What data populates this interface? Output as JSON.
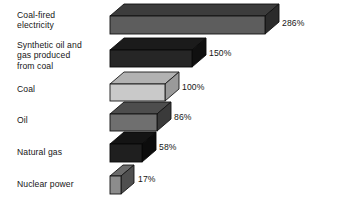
{
  "chart_data": {
    "type": "bar",
    "orientation": "horizontal",
    "style": "3d-isometric",
    "title": "",
    "subtitle": "",
    "xlabel": "",
    "ylabel": "",
    "units": "%",
    "grid": false,
    "legend": null,
    "axis_visible": false,
    "tick_labels": [],
    "xlim": [
      0,
      286
    ],
    "baseline_category": "Coal",
    "baseline_value": 100,
    "categories": [
      "Coal-fired\nelectricity",
      "Synthetic oil and\ngas produced\nfrom coal",
      "Coal",
      "Oil",
      "Natural gas",
      "Nuclear power"
    ],
    "values": [
      286,
      150,
      100,
      86,
      58,
      17
    ],
    "data_labels": [
      "286%",
      "150%",
      "100%",
      "86%",
      "58%",
      "17%"
    ],
    "bar_colors": [
      "#5d5d5d",
      "#262626",
      "#c9c9c9",
      "#6f6f6f",
      "#1f1f1f",
      "#8c8c8c"
    ]
  },
  "bars": [
    {
      "label": "Coal-fired\nelectricity",
      "value_label": "286%",
      "label_top": 10,
      "label_lines": 2,
      "front_x": 110,
      "front_y": 16,
      "front_w": 155,
      "front_h": 18,
      "depth_x": 14,
      "depth_y": 12,
      "face_front": "#5d5d5d",
      "face_top": "#3c3c3c",
      "face_side": "#2b2b2b",
      "edge": "#111111",
      "value_x": 282,
      "value_y": 18
    },
    {
      "label": "Synthetic oil and\ngas produced\nfrom coal",
      "value_label": "150%",
      "label_top": 40,
      "label_lines": 3,
      "front_x": 110,
      "front_y": 50,
      "front_w": 82,
      "front_h": 17,
      "depth_x": 14,
      "depth_y": 12,
      "face_front": "#262626",
      "face_top": "#1b1b1b",
      "face_side": "#101010",
      "edge": "#0a0a0a",
      "value_x": 209,
      "value_y": 48
    },
    {
      "label": "Coal",
      "value_label": "100%",
      "label_top": 84,
      "label_lines": 1,
      "front_x": 110,
      "front_y": 84,
      "front_w": 55,
      "front_h": 17,
      "depth_x": 14,
      "depth_y": 12,
      "face_front": "#c9c9c9",
      "face_top": "#b2b2b2",
      "face_side": "#9a9a9a",
      "edge": "#1a1a1a",
      "value_x": 182,
      "value_y": 82
    },
    {
      "label": "Oil",
      "value_label": "86%",
      "label_top": 115,
      "label_lines": 1,
      "front_x": 110,
      "front_y": 114,
      "front_w": 47,
      "front_h": 17,
      "depth_x": 14,
      "depth_y": 12,
      "face_front": "#6f6f6f",
      "face_top": "#4d4d4d",
      "face_side": "#3a3a3a",
      "edge": "#121212",
      "value_x": 174,
      "value_y": 112
    },
    {
      "label": "Natural gas",
      "value_label": "58%",
      "label_top": 147,
      "label_lines": 1,
      "front_x": 110,
      "front_y": 144,
      "front_w": 32,
      "front_h": 18,
      "depth_x": 14,
      "depth_y": 12,
      "face_front": "#1f1f1f",
      "face_top": "#141414",
      "face_side": "#0c0c0c",
      "edge": "#080808",
      "value_x": 159,
      "value_y": 142
    },
    {
      "label": "Nuclear power",
      "value_label": "17%",
      "label_top": 179,
      "label_lines": 1,
      "front_x": 110,
      "front_y": 176,
      "front_w": 11,
      "front_h": 18,
      "depth_x": 13,
      "depth_y": 11,
      "face_front": "#8c8c8c",
      "face_top": "#6b6b6b",
      "face_side": "#4f4f4f",
      "edge": "#141414",
      "value_x": 138,
      "value_y": 174
    }
  ]
}
